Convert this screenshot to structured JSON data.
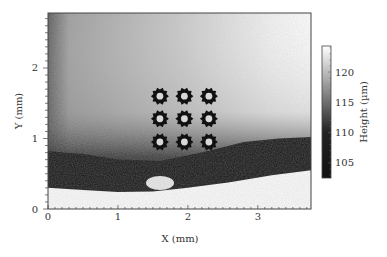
{
  "chart_data": {
    "type": "heatmap",
    "title": "",
    "xlabel": "X (mm)",
    "ylabel": "Y (mm)",
    "xlim": [
      0,
      3.76
    ],
    "ylim": [
      0,
      2.78
    ],
    "xticks": [
      0,
      1,
      2,
      3
    ],
    "yticks": [
      0,
      1,
      2
    ],
    "xtick_labels": [
      "0",
      "1",
      "2",
      "3"
    ],
    "ytick_labels": [
      "0",
      "1",
      "2"
    ],
    "colorbar": {
      "label": "Height (µm)",
      "range": [
        102.5,
        124.3
      ],
      "ticks": [
        105,
        110,
        115,
        120
      ],
      "tick_labels": [
        "105",
        "110",
        "115",
        "120"
      ],
      "colormap": "grayscale (dark = low, white = high)"
    },
    "features": {
      "description": "3x3 array of dark gear-shaped microstructures on a gradient height surface; dark low band near Y≈0.3–0.8 mm with white (no-data/high) region below",
      "gear_centers_mm": [
        [
          1.6,
          1.6
        ],
        [
          1.95,
          1.6
        ],
        [
          2.3,
          1.6
        ],
        [
          1.6,
          1.28
        ],
        [
          1.95,
          1.28
        ],
        [
          2.3,
          1.28
        ],
        [
          1.6,
          0.95
        ],
        [
          1.95,
          0.95
        ],
        [
          2.3,
          0.95
        ]
      ]
    },
    "grid": false,
    "legend": "none"
  }
}
